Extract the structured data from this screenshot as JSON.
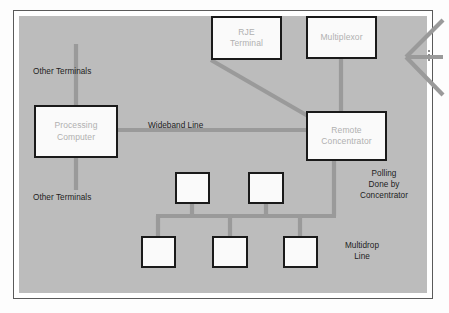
{
  "figure": {
    "kind": "data-communications-network-diagram",
    "background_color": "#bcbcbc",
    "page_color": "#fdfdfd",
    "frame_color": "#5a5a5a",
    "node_fill": "#fafafa",
    "node_border": "#1a1a1a",
    "node_text_color": "#b0b0b0",
    "line_color": "#9a9a9a",
    "label_color": "#1c1c1c"
  },
  "nodes": {
    "processing_computer": {
      "label": "Processing\nComputer",
      "line1": "Processing",
      "line2": "Computer"
    },
    "rje_terminal": {
      "label": "RJE\nTerminal",
      "line1": "RJE",
      "line2": "Terminal"
    },
    "multiplexor": {
      "label": "Multiplexor",
      "line1": "Multiplexor"
    },
    "remote_concentrator": {
      "label": "Remote\nConcentrator",
      "line1": "Remote",
      "line2": "Concentrator"
    },
    "terminal_boxes": [
      {
        "id": "upper-left-terminal",
        "label": ""
      },
      {
        "id": "upper-right-terminal",
        "label": ""
      },
      {
        "id": "lower-left-terminal",
        "label": ""
      },
      {
        "id": "lower-middle-terminal",
        "label": ""
      },
      {
        "id": "lower-right-terminal",
        "label": ""
      }
    ]
  },
  "labels": {
    "other_terminals_top": "Other Terminals",
    "other_terminals_bottom": "Other Terminals",
    "wideband_line": "Wideband Line",
    "polling_line1": "Polling",
    "polling_line2": "Done by",
    "polling_line3": "Concentrator",
    "multidrop_line1": "Multidrop",
    "multidrop_line2": "Line"
  },
  "connections": [
    {
      "name": "other-terminals-trunk",
      "from": "other-terminals-top",
      "to": "other-terminals-bottom",
      "via": "processing-computer",
      "style": "vertical"
    },
    {
      "name": "wideband-link",
      "from": "processing-computer",
      "to": "remote-concentrator",
      "style": "horizontal"
    },
    {
      "name": "rje-link",
      "from": "rje-terminal",
      "to": "remote-concentrator",
      "style": "diagonal"
    },
    {
      "name": "multiplexor-link",
      "from": "multiplexor",
      "to": "remote-concentrator",
      "style": "vertical"
    },
    {
      "name": "multiplexor-fanout",
      "from": "multiplexor",
      "to": "further-terminals",
      "style": "fan",
      "branches": 3
    },
    {
      "name": "multidrop-bus",
      "from": "remote-concentrator",
      "to": "terminal-boxes",
      "style": "bus"
    }
  ]
}
